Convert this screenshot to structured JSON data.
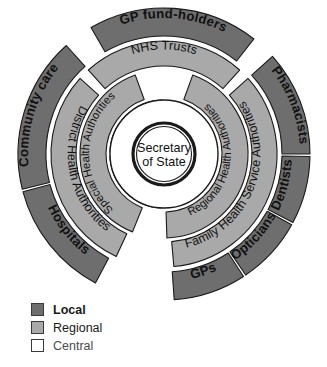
{
  "diagram": {
    "geometry": {
      "cx": 164,
      "cy": 154,
      "outer_ring_outer_r": 146,
      "outer_ring_inner_r": 118,
      "mid_ring_outer_r": 113,
      "mid_ring_inner_r": 88,
      "inner_ring_outer_r": 84,
      "inner_ring_inner_r": 58,
      "core_ring_outer_r": 54,
      "core_ring_inner_r": 31,
      "center_r": 30
    },
    "rings": [
      {
        "id": "outer",
        "level": "Local",
        "color": "#6e6e6e",
        "segments": [
          {
            "label": "Hospitals",
            "start_angle": 208,
            "end_angle": 255
          },
          {
            "label": "Community care",
            "start_angle": 256,
            "end_angle": 318
          },
          {
            "label": "GP fund-holders",
            "start_angle": 330,
            "end_angle": 38
          },
          {
            "label": "Pharmacists",
            "start_angle": 48,
            "end_angle": 90
          },
          {
            "label": "Dentists",
            "start_angle": 91,
            "end_angle": 118
          },
          {
            "label": "Opticians",
            "start_angle": 119,
            "end_angle": 146
          },
          {
            "label": "GPs",
            "start_angle": 147,
            "end_angle": 176
          }
        ]
      },
      {
        "id": "middle",
        "level": "Regional",
        "color": "#a9a9a9",
        "segments": [
          {
            "label": "District Health Authorities",
            "start_angle": 205,
            "end_angle": 312
          },
          {
            "label": "NHS Trusts",
            "start_angle": 318,
            "end_angle": 42
          },
          {
            "label": "Family Health Service Authorities",
            "start_angle": 48,
            "end_angle": 175
          }
        ]
      },
      {
        "id": "inner",
        "level": "Regional",
        "color": "#a9a9a9",
        "segments": [
          {
            "label": "Special Health Authorities",
            "start_angle": 202,
            "end_angle": 340
          },
          {
            "label": "Regional Health Authorities",
            "start_angle": 20,
            "end_angle": 178
          }
        ]
      },
      {
        "id": "core",
        "level": "Central",
        "color": "#ffffff",
        "segments": [
          {
            "label": "Department of Health",
            "start_angle": 182,
            "end_angle": 268
          },
          {
            "label": "NHS Management Executive",
            "start_angle": 272,
            "end_angle": 358
          }
        ]
      }
    ],
    "center": {
      "line1": "Secretary",
      "line2": "of State"
    }
  },
  "legend": {
    "items": [
      {
        "label": "Local",
        "color": "#6e6e6e",
        "bold": true
      },
      {
        "label": "Regional",
        "color": "#a9a9a9",
        "bold": false
      },
      {
        "label": "Central",
        "color": "#ffffff",
        "bold": false
      }
    ]
  }
}
